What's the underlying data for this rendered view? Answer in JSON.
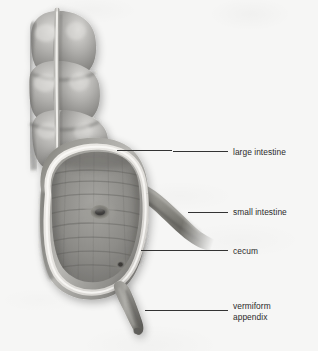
{
  "figure": {
    "style": "grayscale medical illustration",
    "background_color": "#f6f6f5",
    "width": 318,
    "height": 351
  },
  "labels": [
    {
      "id": "large-intestine",
      "text": "large intestine",
      "text_x": 233,
      "text_y": 147,
      "leader": {
        "x1": 116,
        "y1": 150,
        "x2": 228,
        "y2": 152
      }
    },
    {
      "id": "small-intestine",
      "text": "small intestine",
      "text_x": 233,
      "text_y": 207,
      "leader": {
        "x1": 188,
        "y1": 212,
        "x2": 228,
        "y2": 212
      }
    },
    {
      "id": "cecum",
      "text": "cecum",
      "text_x": 233,
      "text_y": 246,
      "leader": {
        "x1": 140,
        "y1": 250,
        "x2": 228,
        "y2": 251
      }
    },
    {
      "id": "vermiform-appendix",
      "text": "vermiform\nappendix",
      "text_x": 233,
      "text_y": 301,
      "leader": {
        "x1": 145,
        "y1": 310,
        "x2": 228,
        "y2": 310
      }
    }
  ],
  "anatomy": {
    "parts": [
      {
        "id": "ascending-colon",
        "name": "large intestine (ascending colon with haustra)"
      },
      {
        "id": "taenia-coli",
        "name": "taenia coli longitudinal band"
      },
      {
        "id": "cecum-body",
        "name": "cecum, opened to show interior"
      },
      {
        "id": "cut-edge",
        "name": "cut edge of cecal wall"
      },
      {
        "id": "ileocecal-orifice",
        "name": "ileocecal orifice"
      },
      {
        "id": "appendiceal-orifice",
        "name": "appendiceal orifice"
      },
      {
        "id": "ileum",
        "name": "small intestine (terminal ileum)"
      },
      {
        "id": "vermiform-appendix",
        "name": "vermiform appendix"
      }
    ]
  },
  "colors": {
    "tissue_light": "#d3d2d0",
    "tissue_mid": "#9a9996",
    "tissue_dark": "#6d6c6a",
    "tissue_shadow": "#4f4e4c",
    "cut_edge": "#e8e7e4",
    "interior": "#8e8d8a",
    "leader_line": "#333333",
    "label_text": "#2b2b2b"
  }
}
